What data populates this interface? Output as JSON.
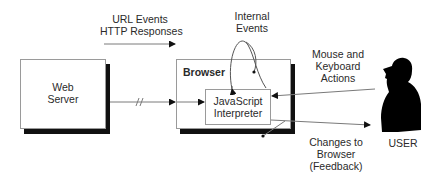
{
  "diagram": {
    "nodes": {
      "web_server": {
        "label_line1": "Web",
        "label_line2": "Server"
      },
      "browser": {
        "label": "Browser"
      },
      "js_interpreter": {
        "label_line1": "JavaScript",
        "label_line2": "Interpreter"
      },
      "user": {
        "label": "USER"
      }
    },
    "edge_labels": {
      "url_events": {
        "line1": "URL Events",
        "line2": "HTTP Responses"
      },
      "internal_events": {
        "line1": "Internal",
        "line2": "Events"
      },
      "mouse_keyboard": {
        "line1": "Mouse and",
        "line2": "Keyboard",
        "line3": "Actions"
      },
      "changes": {
        "line1": "Changes to",
        "line2": "Browser",
        "line3": "(Feedback)"
      }
    },
    "colors": {
      "line": "#7a7a7a",
      "shadow": "#111111",
      "silhouette": "#000000"
    }
  }
}
